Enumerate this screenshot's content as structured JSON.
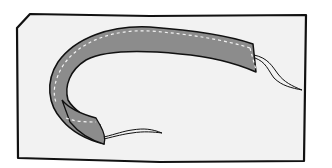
{
  "illustration": {
    "subject": "fabric strip (bias tape) curved on fabric panel with thread ends",
    "colors": {
      "background": "#ffffff",
      "panel_fill": "#f2f2f2",
      "outline": "#111111",
      "strip_fill": "#8c8c8c",
      "stitch": "#f4f4f4"
    }
  }
}
